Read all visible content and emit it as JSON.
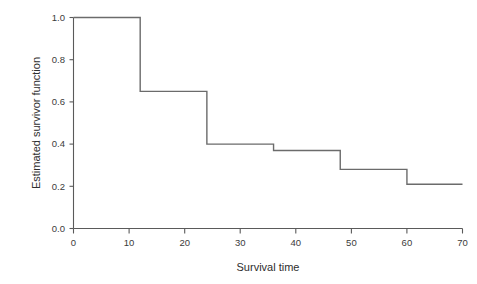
{
  "chart_data": {
    "type": "line",
    "subtype": "step-post",
    "title": "",
    "xlabel": "Survival time",
    "ylabel": "Estimated survivor function",
    "xlim": [
      0,
      70
    ],
    "ylim": [
      0.0,
      1.0
    ],
    "xticks": [
      0,
      10,
      20,
      30,
      40,
      50,
      60,
      70
    ],
    "xtick_labels": [
      "0",
      "10",
      "20",
      "30",
      "40",
      "50",
      "60",
      "70"
    ],
    "yticks": [
      0.0,
      0.2,
      0.4,
      0.6,
      0.8,
      1.0
    ],
    "ytick_labels": [
      "0.0",
      "0.2",
      "0.4",
      "0.6",
      "0.8",
      "1.0"
    ],
    "grid": false,
    "legend": false,
    "series": [
      {
        "name": "Estimated survivor function",
        "color": "#6b6b6b",
        "x": [
          0,
          12,
          24,
          36,
          48,
          60,
          70
        ],
        "y": [
          1.0,
          0.65,
          0.4,
          0.37,
          0.28,
          0.21,
          0.21
        ],
        "step_points": [
          {
            "time": 0,
            "survival": 1.0
          },
          {
            "time": 12,
            "survival": 0.65
          },
          {
            "time": 24,
            "survival": 0.4
          },
          {
            "time": 36,
            "survival": 0.37
          },
          {
            "time": 48,
            "survival": 0.28
          },
          {
            "time": 60,
            "survival": 0.21
          },
          {
            "time": 70,
            "survival": 0.21
          }
        ]
      }
    ]
  },
  "figure": {
    "background_color": "#ffffff",
    "axis_color": "#5a5a5a",
    "line_color": "#6b6b6b",
    "text_color": "#2e2e2e"
  }
}
